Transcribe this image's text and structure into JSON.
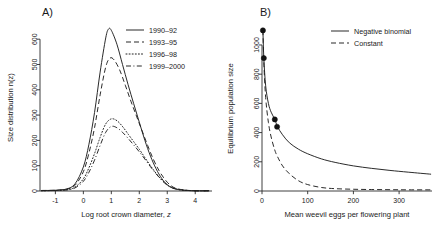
{
  "figure": {
    "panels": [
      {
        "label": "A)",
        "xlabel_main": "Log root crown diameter, ",
        "xlabel_italic": "z",
        "ylabel": "Size distribution n(z)",
        "xticks": [
          "-1",
          "0",
          "1",
          "2",
          "3",
          "4"
        ],
        "yticks": [
          "0",
          "100",
          "200",
          "300",
          "400",
          "500",
          "600"
        ],
        "legend": [
          {
            "label": "1990–92",
            "dash": "none"
          },
          {
            "label": "1993–95",
            "dash": "dashed"
          },
          {
            "label": "1996–98",
            "dash": "dotted"
          },
          {
            "label": "1999–2000",
            "dash": "dashdot"
          }
        ]
      },
      {
        "label": "B)",
        "xlabel_main": "Mean weevil eggs per flowering plant",
        "xlabel_italic": "",
        "ylabel": "Equilibrium population size",
        "xticks": [
          "0",
          "100",
          "200",
          "300"
        ],
        "yticks": [
          "0",
          "200",
          "400",
          "600",
          "800",
          "1000"
        ],
        "legend": [
          {
            "label": "Negative binomial",
            "dash": "none"
          },
          {
            "label": "Constant",
            "dash": "dashed"
          }
        ]
      }
    ]
  },
  "chart_data": [
    {
      "type": "line",
      "title": "A)",
      "xlabel": "Log root crown diameter, z",
      "ylabel": "Size distribution n(z)",
      "xlim": [
        -1.55,
        4.6
      ],
      "ylim": [
        0,
        660
      ],
      "xticks": [
        -1,
        0,
        1,
        2,
        3,
        4
      ],
      "yticks": [
        0,
        100,
        200,
        300,
        400,
        500,
        600
      ],
      "grid": false,
      "legend_position": "top-right",
      "series": [
        {
          "name": "1990–92",
          "style": "solid",
          "peak_x": 0.9,
          "peak_y": 640,
          "x": [
            -1.5,
            -1.0,
            -0.6,
            -0.3,
            0.0,
            0.2,
            0.4,
            0.6,
            0.8,
            0.9,
            1.0,
            1.2,
            1.4,
            1.6,
            1.8,
            2.0,
            2.2,
            2.4,
            2.6,
            2.8,
            3.0,
            3.2,
            3.5,
            4.0,
            4.5
          ],
          "y": [
            2,
            3,
            8,
            28,
            95,
            185,
            310,
            470,
            605,
            640,
            635,
            580,
            500,
            420,
            345,
            272,
            200,
            138,
            88,
            50,
            25,
            12,
            4,
            1,
            1
          ]
        },
        {
          "name": "1993–95",
          "style": "dashed",
          "peak_x": 0.95,
          "peak_y": 525,
          "x": [
            -1.5,
            -1.0,
            -0.6,
            -0.3,
            0.0,
            0.2,
            0.4,
            0.6,
            0.8,
            0.95,
            1.1,
            1.3,
            1.5,
            1.7,
            1.9,
            2.1,
            2.3,
            2.5,
            2.7,
            2.9,
            3.1,
            3.3,
            3.6,
            4.0,
            4.5
          ],
          "y": [
            2,
            3,
            7,
            22,
            76,
            150,
            250,
            380,
            490,
            525,
            518,
            478,
            418,
            355,
            296,
            238,
            180,
            126,
            82,
            48,
            24,
            11,
            4,
            1,
            1
          ]
        },
        {
          "name": "1996–98",
          "style": "dotted",
          "peak_x": 1.0,
          "peak_y": 285,
          "x": [
            -1.5,
            -1.0,
            -0.6,
            -0.3,
            0.0,
            0.2,
            0.4,
            0.6,
            0.8,
            1.0,
            1.2,
            1.4,
            1.6,
            1.8,
            2.0,
            2.2,
            2.4,
            2.6,
            2.8,
            3.0,
            3.2,
            3.5,
            4.0,
            4.5
          ],
          "y": [
            1,
            2,
            5,
            15,
            48,
            92,
            148,
            212,
            265,
            285,
            278,
            255,
            225,
            195,
            165,
            132,
            100,
            70,
            44,
            24,
            12,
            4,
            1,
            1
          ]
        },
        {
          "name": "1999–2000",
          "style": "dashdot",
          "peak_x": 1.0,
          "peak_y": 255,
          "x": [
            -1.5,
            -1.0,
            -0.6,
            -0.3,
            0.0,
            0.2,
            0.4,
            0.6,
            0.8,
            1.0,
            1.2,
            1.4,
            1.6,
            1.8,
            2.0,
            2.2,
            2.4,
            2.6,
            2.8,
            3.0,
            3.2,
            3.5,
            4.0,
            4.5
          ],
          "y": [
            1,
            2,
            4,
            12,
            38,
            74,
            122,
            180,
            232,
            255,
            250,
            232,
            208,
            182,
            155,
            126,
            96,
            68,
            43,
            23,
            11,
            4,
            1,
            1
          ]
        }
      ]
    },
    {
      "type": "line",
      "title": "B)",
      "xlabel": "Mean weevil eggs per flowering plant",
      "ylabel": "Equilibrium population size",
      "xlim": [
        0,
        372
      ],
      "ylim": [
        0,
        1130
      ],
      "xticks": [
        0,
        100,
        200,
        300
      ],
      "yticks": [
        0,
        200,
        400,
        600,
        800,
        1000
      ],
      "grid": false,
      "legend_position": "top-right",
      "series": [
        {
          "name": "Negative binomial",
          "style": "solid",
          "x": [
            2,
            4,
            8,
            14,
            20,
            28,
            34,
            45,
            60,
            80,
            100,
            130,
            160,
            200,
            240,
            280,
            320,
            370
          ],
          "y": [
            1100,
            910,
            720,
            600,
            540,
            490,
            440,
            385,
            330,
            286,
            255,
            220,
            196,
            172,
            155,
            141,
            129,
            115
          ]
        },
        {
          "name": "Constant",
          "style": "dashed",
          "x": [
            2,
            4,
            8,
            14,
            20,
            28,
            34,
            45,
            60,
            80,
            100,
            130,
            160,
            200,
            240,
            280,
            320,
            370
          ],
          "y": [
            1100,
            880,
            640,
            470,
            370,
            280,
            235,
            172,
            118,
            70,
            44,
            24,
            16,
            12,
            10,
            9,
            8,
            8
          ]
        }
      ],
      "points": [
        {
          "x": 2,
          "y": 1100
        },
        {
          "x": 4,
          "y": 910
        },
        {
          "x": 28,
          "y": 490
        },
        {
          "x": 33,
          "y": 440
        }
      ]
    }
  ]
}
